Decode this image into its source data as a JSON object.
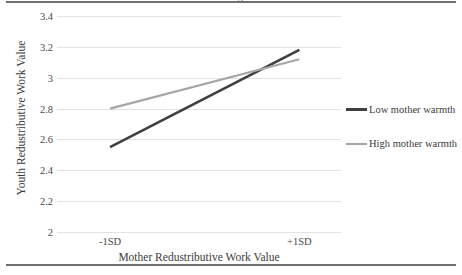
{
  "figure": {
    "caption_fragment": "moderating role of mother warmth",
    "background": "#ffffff",
    "frame_rule_color": "#6f6f6f"
  },
  "chart_data": {
    "type": "line",
    "title": "",
    "xlabel": "Mother Redustributive Work Value",
    "ylabel": "Youth Redustributive Work Value",
    "categories": [
      "-1SD",
      "+1SD"
    ],
    "x": [
      0,
      1
    ],
    "xtick_labels": [
      "-1SD",
      "+1SD"
    ],
    "ytick_labels": [
      "3.4",
      "3.2",
      "3",
      "2.8",
      "2.6",
      "2.4",
      "2.2",
      "2"
    ],
    "ytick_values": [
      3.4,
      3.2,
      3.0,
      2.8,
      2.6,
      2.4,
      2.2,
      2.0
    ],
    "ylim": [
      2.0,
      3.4
    ],
    "xlim": [
      -0.28,
      1.22
    ],
    "grid": true,
    "grid_color": "#e2e2e2",
    "legend_position": "right",
    "series": [
      {
        "name": "Low mother warmth",
        "color": "#3f3f3f",
        "width": 2.6,
        "values": [
          2.55,
          3.18
        ]
      },
      {
        "name": "High mother warmth",
        "color": "#a6a6a6",
        "width": 2.2,
        "values": [
          2.8,
          3.12
        ]
      }
    ]
  },
  "legend": {
    "items": [
      {
        "label": "Low mother warmth",
        "color": "#3f3f3f"
      },
      {
        "label": "High mother warmth",
        "color": "#a6a6a6"
      }
    ]
  }
}
